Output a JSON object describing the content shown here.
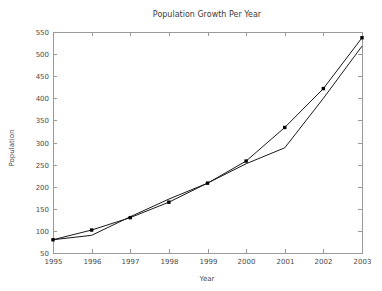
{
  "chart_data": {
    "type": "line",
    "title": "Population Growth Per Year",
    "xlabel": "Year",
    "ylabel": "Population",
    "x": [
      1995,
      1996,
      1997,
      1998,
      1999,
      2000,
      2001,
      2002,
      2003
    ],
    "categories": [
      "1995",
      "1996",
      "1997",
      "1998",
      "1999",
      "2000",
      "2001",
      "2002",
      "2003"
    ],
    "xlim": [
      1995,
      2003
    ],
    "ylim": [
      50,
      550
    ],
    "yticks": [
      50,
      100,
      150,
      200,
      250,
      300,
      350,
      400,
      450,
      500,
      550
    ],
    "ytick_labels": [
      "50",
      "100",
      "150",
      "200",
      "250",
      "300",
      "350",
      "400",
      "450",
      "500",
      "550"
    ],
    "xticks": [
      1995,
      1996,
      1997,
      1998,
      1999,
      2000,
      2001,
      2002,
      2003
    ],
    "xtick_labels": [
      "1995",
      "1996",
      "1997",
      "1998",
      "1999",
      "2000",
      "2001",
      "2002",
      "2003"
    ],
    "grid": false,
    "legend": "none",
    "tick_direction": "in",
    "series": [
      {
        "name": "population-markers",
        "marker": "square",
        "values": [
          80,
          102,
          130,
          165,
          208,
          258,
          334,
          422,
          537
        ]
      },
      {
        "name": "population-trend",
        "marker": "none",
        "values": [
          80,
          90,
          132,
          172,
          208,
          252,
          288,
          400,
          518
        ]
      }
    ],
    "colors": {
      "line": "#1a1a1a",
      "marker": "#000000",
      "axis": "#9a9a9a",
      "text": "#4a4a4a",
      "background": "#ffffff"
    }
  },
  "plot_geometry": {
    "left": 53,
    "right": 362,
    "top": 32,
    "bottom": 253,
    "tick_length": 4,
    "marker_size": 3.4,
    "title_x": 207,
    "title_y": 17,
    "xlabel_x": 207,
    "xlabel_y": 281,
    "ylabel_x": 14,
    "ylabel_y": 148
  }
}
